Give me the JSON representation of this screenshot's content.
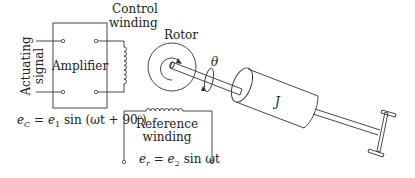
{
  "labels": {
    "actuating_signal_line1": "Actuating",
    "actuating_signal_line2": "signal",
    "amplifier": "Amplifier",
    "control_winding_line1": "Control",
    "control_winding_line2": "winding",
    "rotor": "Rotor",
    "theta": "θ",
    "load_inertia": "J",
    "reference_winding_line1": "Reference",
    "reference_winding_line2": "winding"
  },
  "equations": {
    "control_voltage": {
      "lhs": "e",
      "lhs_sub": "C",
      "rhs_prefix": " = e",
      "rhs_sub": "1",
      "rhs_body": " sin (ωt + 90",
      "rhs_sup": "o",
      "rhs_suffix": ")"
    },
    "reference_voltage": {
      "lhs": "e",
      "lhs_sub": "r",
      "rhs_prefix": " = e",
      "rhs_sub": "2",
      "rhs_body": " sin ωt"
    }
  },
  "colors": {
    "stroke": "#333333",
    "text": "#222222",
    "background": "#ffffff"
  }
}
